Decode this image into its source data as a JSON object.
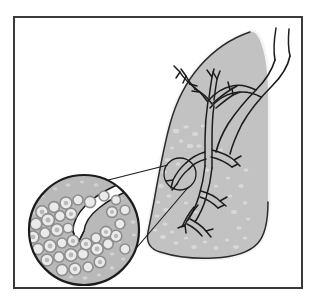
{
  "figure": {
    "type": "medical-illustration",
    "canvas": {
      "width": 317,
      "height": 303
    },
    "background_color": "#ffffff"
  },
  "frame": {
    "name": "illustration-border",
    "x": 14,
    "y": 17,
    "width": 288,
    "height": 271,
    "stroke_color": "#3a3a3a",
    "stroke_width": 2,
    "fill_color": "#ffffff"
  },
  "lung": {
    "label": "lung",
    "fill_color": "#c2c2c2",
    "rim_color": "#f2f2f2",
    "outline_color": "#2b2b2b",
    "outline_width": 1.6,
    "rim_width": 3.2,
    "speckle_color": "#d7d7d7",
    "speckle_count": 46
  },
  "airway": {
    "label": "bronchial-tree",
    "lumen_color": "#ffffff",
    "outline_color": "#1c1c1c",
    "outline_width": 1.5,
    "trachea_label": "trachea",
    "main_bronchus_label": "main-bronchus",
    "upper_branch_label": "upper-lobe-bronchus",
    "lower_branch_label": "lower-lobe-bronchus"
  },
  "callout": {
    "label": "magnification-callout",
    "small_circle": {
      "cx": 180,
      "cy": 174,
      "r": 16
    },
    "large_circle": {
      "cx": 84,
      "cy": 230,
      "r": 55
    },
    "leader_stroke_color": "#1c1c1c",
    "leader_stroke_width": 1.2
  },
  "inset": {
    "label": "alveoli-magnified-view",
    "background_color": "#b9b9b9",
    "border_color": "#1c1c1c",
    "border_width": 2.2,
    "bronchiole_color": "#ffffff",
    "alveoli_outline_color": "#8f8f8f",
    "alveoli_fill_color": "#e9e9e9",
    "speck_color": "#d2d2d2",
    "alveoli_cluster_count": 38
  },
  "colors": {
    "ink": "#1c1c1c",
    "frame": "#3a3a3a",
    "tissue_gray": "#c2c2c2",
    "inset_gray": "#b9b9b9",
    "highlight_white": "#ffffff"
  }
}
